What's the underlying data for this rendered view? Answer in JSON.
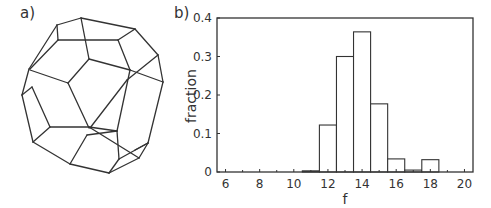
{
  "panels": {
    "a_label": "a)",
    "b_label": "b)"
  },
  "diagram": {
    "edges": [
      [
        57,
        25,
        81,
        18
      ],
      [
        81,
        18,
        135,
        29
      ],
      [
        135,
        29,
        158,
        55
      ],
      [
        158,
        55,
        163,
        82
      ],
      [
        163,
        82,
        148,
        143
      ],
      [
        148,
        143,
        139,
        158
      ],
      [
        139,
        158,
        109,
        173
      ],
      [
        109,
        173,
        70,
        164
      ],
      [
        70,
        164,
        33,
        142
      ],
      [
        33,
        142,
        22,
        95
      ],
      [
        22,
        95,
        29,
        69
      ],
      [
        29,
        69,
        57,
        25
      ],
      [
        57,
        25,
        58,
        40
      ],
      [
        58,
        40,
        118,
        40
      ],
      [
        118,
        40,
        135,
        29
      ],
      [
        81,
        18,
        89,
        59
      ],
      [
        58,
        40,
        30,
        69
      ],
      [
        89,
        59,
        68,
        83
      ],
      [
        89,
        59,
        130,
        70
      ],
      [
        68,
        83,
        30,
        70
      ],
      [
        118,
        40,
        130,
        70
      ],
      [
        130,
        70,
        163,
        82
      ],
      [
        158,
        55,
        127,
        80
      ],
      [
        127,
        80,
        90,
        128
      ],
      [
        130,
        70,
        117,
        131
      ],
      [
        22,
        95,
        32,
        87
      ],
      [
        32,
        87,
        50,
        127
      ],
      [
        68,
        83,
        89,
        128
      ],
      [
        50,
        127,
        89,
        127
      ],
      [
        89,
        127,
        117,
        131
      ],
      [
        50,
        127,
        33,
        142
      ],
      [
        70,
        164,
        87,
        135
      ],
      [
        87,
        135,
        117,
        131
      ],
      [
        117,
        131,
        119,
        159
      ],
      [
        119,
        159,
        109,
        173
      ],
      [
        119,
        159,
        148,
        143
      ],
      [
        89,
        127,
        139,
        158
      ],
      [
        135,
        150,
        148,
        143
      ]
    ]
  },
  "chart_data": {
    "type": "bar",
    "title": "",
    "xlabel": "f",
    "ylabel": "fraction",
    "xlim": [
      5.5,
      20.5
    ],
    "ylim": [
      0,
      0.4
    ],
    "xticks": [
      6,
      8,
      10,
      12,
      14,
      16,
      18,
      20
    ],
    "xticks_minor": [
      7,
      9,
      11,
      13,
      15,
      17,
      19
    ],
    "yticks": [
      0,
      0.1,
      0.2,
      0.3,
      0.4
    ],
    "ytick_labels": [
      "0",
      "0.1",
      "0.2",
      "0.3",
      "0.4"
    ],
    "xtick_labels": [
      "6",
      "8",
      "10",
      "12",
      "14",
      "16",
      "18",
      "20"
    ],
    "grid": false,
    "legend": null,
    "categories": [
      11,
      12,
      13,
      14,
      15,
      16,
      17,
      18
    ],
    "values": [
      0.003,
      0.122,
      0.3,
      0.364,
      0.177,
      0.034,
      0.005,
      0.032
    ]
  }
}
